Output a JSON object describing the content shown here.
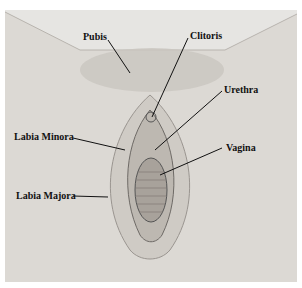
{
  "diagram": {
    "type": "anatomical-illustration",
    "labels": [
      {
        "id": "pubis",
        "text": "Pubis"
      },
      {
        "id": "clitoris",
        "text": "Clitoris"
      },
      {
        "id": "urethra",
        "text": "Urethra"
      },
      {
        "id": "labia_minora",
        "text": "Labia Minora"
      },
      {
        "id": "vagina",
        "text": "Vagina"
      },
      {
        "id": "labia_majora",
        "text": "Labia Majora"
      }
    ],
    "colors": {
      "background": "#e6e5e2",
      "skin": "#d9d6d1",
      "shade": "#9a9590",
      "line": "#111111"
    }
  }
}
